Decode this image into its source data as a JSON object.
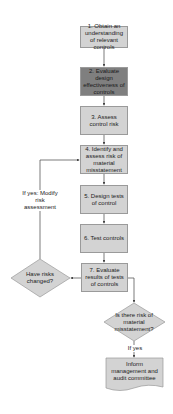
{
  "steps": [
    {
      "id": 1,
      "label": "1. Obtain an understanding of relevant controls"
    },
    {
      "id": 2,
      "label": "2. Evaluate design effectiveness of controls",
      "highlighted": true
    },
    {
      "id": 3,
      "label": "3. Assess control risk"
    },
    {
      "id": 4,
      "label": "4. Identify and assess risk of material misstatement"
    },
    {
      "id": 5,
      "label": "5. Design tests of control"
    },
    {
      "id": 6,
      "label": "6. Test controls"
    },
    {
      "id": 7,
      "label": "7. Evaluate results of tests of controls"
    }
  ],
  "decisions": {
    "risks_changed": "Have risks changed?",
    "material_misstatement": "Is there risk of material misstatement?"
  },
  "edge_labels": {
    "modify": "If yes: Modify risk assessment",
    "if_yes": "If yes"
  },
  "output_doc": "Inform management and audit committee",
  "colors": {
    "box_fill": "#d3d3d3",
    "highlight_fill": "#7f7f7f",
    "border": "#9a9a9a",
    "line": "#444444"
  }
}
